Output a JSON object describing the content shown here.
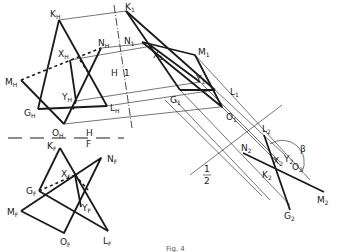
{
  "figure": {
    "caption": "Fig. 4",
    "fold_lines": {
      "hf": {
        "top": "H",
        "bottom": "F"
      },
      "h1": {
        "left": "H",
        "right": "1"
      },
      "one_two": {
        "top": "1",
        "bottom": "2"
      }
    },
    "angle_label": "β",
    "views": {
      "top_H": {
        "points": {
          "K": {
            "name": "K",
            "sub": "H"
          },
          "N": {
            "name": "N",
            "sub": "H"
          },
          "X": {
            "name": "X",
            "sub": "H"
          },
          "M": {
            "name": "M",
            "sub": "H"
          },
          "Y": {
            "name": "Y",
            "sub": "H"
          },
          "G": {
            "name": "G",
            "sub": "H"
          },
          "L": {
            "name": "L",
            "sub": "H"
          },
          "O": {
            "name": "O",
            "sub": "H"
          }
        }
      },
      "front_F": {
        "points": {
          "K": {
            "name": "K",
            "sub": "F"
          },
          "N": {
            "name": "N",
            "sub": "F"
          },
          "X": {
            "name": "X",
            "sub": "F"
          },
          "G": {
            "name": "G",
            "sub": "F"
          },
          "M": {
            "name": "M",
            "sub": "F"
          },
          "Y": {
            "name": "Y",
            "sub": "F"
          },
          "O": {
            "name": "O",
            "sub": "F"
          },
          "L": {
            "name": "L",
            "sub": "F"
          }
        }
      },
      "aux_1": {
        "points": {
          "K": {
            "name": "K",
            "sub": "1"
          },
          "N": {
            "name": "N",
            "sub": "1"
          },
          "X": {
            "name": "X",
            "sub": "1"
          },
          "M": {
            "name": "M",
            "sub": "1"
          },
          "Y": {
            "name": "Y",
            "sub": "1"
          },
          "G": {
            "name": "G",
            "sub": "1"
          },
          "L": {
            "name": "L",
            "sub": "1"
          },
          "O": {
            "name": "O",
            "sub": "1"
          }
        }
      },
      "aux_2": {
        "points": {
          "L": {
            "name": "L",
            "sub": "2"
          },
          "N": {
            "name": "N",
            "sub": "2"
          },
          "X": {
            "name": "X",
            "sub": "2"
          },
          "Y": {
            "name": "Y",
            "sub": "2"
          },
          "O": {
            "name": "O",
            "sub": "2"
          },
          "K": {
            "name": "K",
            "sub": "2"
          },
          "M": {
            "name": "M",
            "sub": "2"
          },
          "G": {
            "name": "G",
            "sub": "2"
          }
        }
      }
    }
  }
}
